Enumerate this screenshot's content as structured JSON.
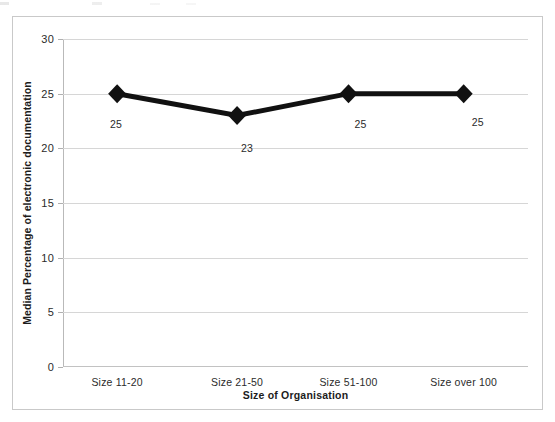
{
  "chart_data": {
    "type": "line",
    "title": "",
    "subtitle": "",
    "xlabel": "Size of Organisation",
    "ylabel": "Median Percentage of electronic documentation",
    "categories": [
      "Size 11-20",
      "Size 21-50",
      "Size 51-100",
      "Size over 100"
    ],
    "values": [
      25,
      23,
      25,
      25
    ],
    "point_labels": [
      "25",
      "23",
      "25",
      "25"
    ],
    "series": [
      {
        "name": "Median percentage of electronic documentation",
        "values": [
          25,
          23,
          25,
          25
        ]
      }
    ],
    "ylim": [
      0,
      30
    ],
    "ytick_labels": [
      "0",
      "5",
      "10",
      "15",
      "20",
      "25",
      "30"
    ],
    "ytick_values": [
      0,
      5,
      10,
      15,
      20,
      25,
      30
    ],
    "ystep": 5,
    "grid": "horizontal",
    "legend": "none",
    "legend_position": "",
    "marker": "diamond",
    "line_color": "#111111",
    "marker_color": "#111111",
    "gridline_color": "#d6d6d6",
    "axis_color": "#b9b9b9",
    "background_color": "#ffffff",
    "border_color": "#c9c9c9"
  }
}
